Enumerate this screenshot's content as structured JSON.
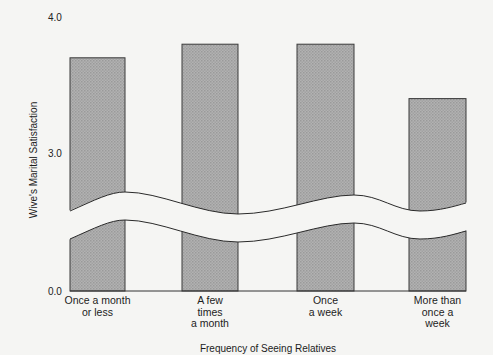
{
  "chart_data": {
    "type": "bar",
    "title": "",
    "xlabel": "Frequency of Seeing Relatives",
    "ylabel": "Wive's Marital Satisfaction",
    "categories": [
      "Once a month or less",
      "A few times a month",
      "Once a week",
      "More than once a week"
    ],
    "category_lines": [
      [
        "Once a month",
        "or less"
      ],
      [
        "A few",
        "times",
        "a month"
      ],
      [
        "Once",
        "a week"
      ],
      [
        "More than",
        "once a",
        "week"
      ]
    ],
    "values": [
      3.7,
      3.8,
      3.8,
      3.4
    ],
    "yticks": [
      "0.0",
      "3.0",
      "4.0"
    ],
    "ylim": [
      0,
      4.0
    ],
    "axis_break": {
      "between": [
        0.0,
        3.0
      ],
      "style": "wavy"
    },
    "grid": false,
    "legend": null,
    "colors": {
      "bar_fill": "#a9a9a9",
      "bar_edge": "#3a3a3a",
      "background": "#f5f5f3"
    }
  }
}
